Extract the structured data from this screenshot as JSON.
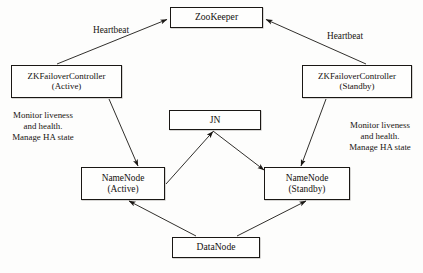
{
  "diagram": {
    "background_color": "#fdfdfc",
    "line_color": "#1a1714",
    "nodes": [
      {
        "id": "zookeeper",
        "label": "ZooKeeper",
        "sub": ""
      },
      {
        "id": "zkfc_active",
        "label": "ZKFailoverController",
        "sub": "(Active)"
      },
      {
        "id": "zkfc_standby",
        "label": "ZKFailoverController",
        "sub": "(Standby)"
      },
      {
        "id": "jn",
        "label": "JN",
        "sub": ""
      },
      {
        "id": "namenode_active",
        "label": "NameNode",
        "sub": "(Active)"
      },
      {
        "id": "namenode_standby",
        "label": "NameNode",
        "sub": "(Standby)"
      },
      {
        "id": "datanode",
        "label": "DataNode",
        "sub": ""
      }
    ],
    "edge_labels": [
      {
        "id": "heartbeat_left",
        "lines": [
          "Heartbeat"
        ]
      },
      {
        "id": "heartbeat_right",
        "lines": [
          "Heartbeat"
        ]
      },
      {
        "id": "monitor_left",
        "lines": [
          "Monitor liveness",
          "and health.",
          "Manage HA state"
        ]
      },
      {
        "id": "monitor_right",
        "lines": [
          "Monitor liveness",
          "and health.",
          "Manage HA state"
        ]
      }
    ],
    "edges": [
      {
        "from": "zkfc_active",
        "to": "zookeeper",
        "label": "Heartbeat",
        "arrow": "to"
      },
      {
        "from": "zkfc_standby",
        "to": "zookeeper",
        "label": "Heartbeat",
        "arrow": "to"
      },
      {
        "from": "zkfc_active",
        "to": "namenode_active",
        "label": "Monitor liveness and health. Manage HA state",
        "arrow": "to"
      },
      {
        "from": "zkfc_standby",
        "to": "namenode_standby",
        "label": "Monitor liveness and health. Manage HA state",
        "arrow": "to"
      },
      {
        "from": "namenode_active",
        "to": "jn",
        "label": "",
        "arrow": "to"
      },
      {
        "from": "jn",
        "to": "namenode_standby",
        "label": "",
        "arrow": "to"
      },
      {
        "from": "datanode",
        "to": "namenode_active",
        "label": "",
        "arrow": "to"
      },
      {
        "from": "datanode",
        "to": "namenode_standby",
        "label": "",
        "arrow": "to"
      }
    ]
  }
}
